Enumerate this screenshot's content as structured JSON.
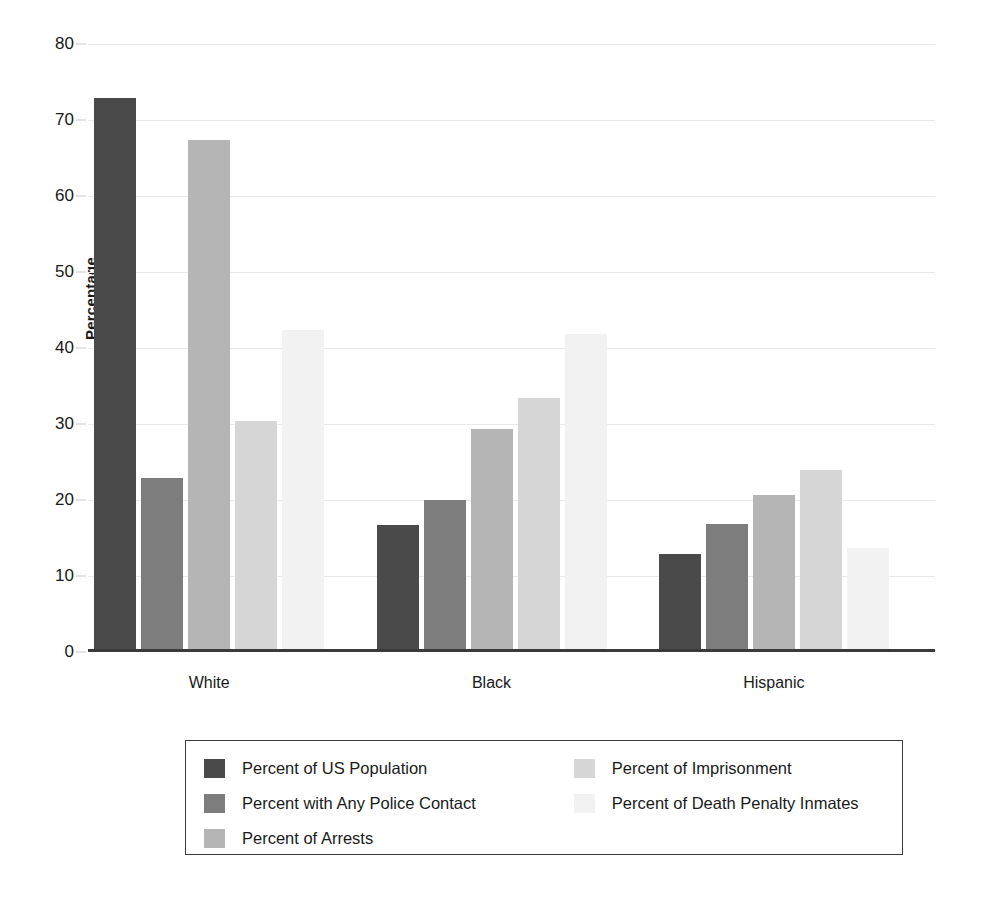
{
  "chart_data": {
    "type": "bar",
    "title": "",
    "subtitle": "",
    "xlabel": "",
    "ylabel": "Percentage",
    "ylim": [
      0,
      80
    ],
    "ytick_step": 10,
    "yticks": [
      0,
      10,
      20,
      30,
      40,
      50,
      60,
      70,
      80
    ],
    "ytick_labels": [
      "0",
      "10",
      "20",
      "30",
      "40",
      "50",
      "60",
      "70",
      "80"
    ],
    "grid": true,
    "grid_axis": "y",
    "legend_position": "below-center",
    "categories": [
      "White",
      "Black",
      "Hispanic"
    ],
    "series": [
      {
        "name": "Percent of US Population",
        "color": "#4a4a4a",
        "values": [
          72.5,
          16.3,
          12.5
        ]
      },
      {
        "name": "Percent with Any Police Contact",
        "color": "#7d7d7d",
        "values": [
          22.5,
          19.6,
          16.5
        ]
      },
      {
        "name": "Percent of Arrests",
        "color": "#b5b5b5",
        "values": [
          67.0,
          29.0,
          20.2
        ]
      },
      {
        "name": "Percent of Imprisonment",
        "color": "#d6d6d6",
        "values": [
          30.0,
          33.0,
          23.5
        ]
      },
      {
        "name": "Percent of Death Penalty Inmates",
        "color": "#f2f2f2",
        "values": [
          42.0,
          41.5,
          13.3
        ]
      }
    ]
  },
  "legend": {
    "columns": [
      {
        "items": [
          {
            "label": "Percent of US Population",
            "color": "#4a4a4a"
          },
          {
            "label": "Percent with Any Police Contact",
            "color": "#7d7d7d"
          },
          {
            "label": "Percent of Arrests",
            "color": "#b5b5b5"
          }
        ]
      },
      {
        "items": [
          {
            "label": "Percent of Imprisonment",
            "color": "#d6d6d6"
          },
          {
            "label": "Percent of Death Penalty Inmates",
            "color": "#f2f2f2"
          }
        ]
      }
    ]
  },
  "style": {
    "background": "#ffffff",
    "axis_color": "#3a3a3a",
    "grid_color": "#e9e9e9",
    "text_color": "#1a1a1a"
  }
}
